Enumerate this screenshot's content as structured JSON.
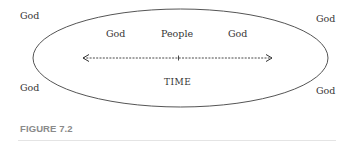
{
  "figure": {
    "corner_labels": {
      "top_left": "God",
      "top_right": "God",
      "bottom_left": "God",
      "bottom_right": "God"
    },
    "inner_labels": {
      "left": "God",
      "center": "People",
      "right": "God"
    },
    "axis_label": "TIME",
    "caption": "FIGURE 7.2",
    "colors": {
      "line": "#555555",
      "text": "#333333",
      "caption": "#8a8a8a"
    }
  }
}
